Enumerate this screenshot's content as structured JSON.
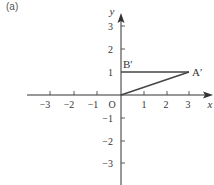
{
  "panel_label": "(a)",
  "axes": {
    "x_label": "x",
    "y_label": "y",
    "origin_label": "O",
    "x_ticks": [
      {
        "value": -3,
        "label": "−3"
      },
      {
        "value": -2,
        "label": "−2"
      },
      {
        "value": -1,
        "label": "−1"
      },
      {
        "value": 1,
        "label": "1"
      },
      {
        "value": 2,
        "label": "2"
      },
      {
        "value": 3,
        "label": "3"
      }
    ],
    "y_ticks": [
      {
        "value": 3,
        "label": "3"
      },
      {
        "value": 2,
        "label": "2"
      },
      {
        "value": 1,
        "label": "1"
      },
      {
        "value": -1,
        "label": "−1"
      },
      {
        "value": -2,
        "label": "−2"
      },
      {
        "value": -3,
        "label": "−3"
      }
    ]
  },
  "shape": {
    "points": [
      {
        "name": "O",
        "x": 0,
        "y": 0
      },
      {
        "name": "A'",
        "label": "A′",
        "x": 3,
        "y": 1
      },
      {
        "name": "B'",
        "label": "B′",
        "x": 0,
        "y": 1
      }
    ],
    "segments": [
      [
        "O",
        "A'"
      ],
      [
        "A'",
        "B'"
      ]
    ]
  },
  "colors": {
    "axis": "#333333",
    "shape": "#444444"
  }
}
